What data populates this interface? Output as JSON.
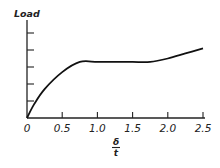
{
  "chart_data": {
    "type": "line",
    "title": "",
    "ylabel": "Load",
    "xlabel": "δ / t",
    "xlabel_numerator": "δ",
    "xlabel_denominator": "t",
    "x_ticks": [
      0,
      0.5,
      1.0,
      1.5,
      2.0,
      2.5
    ],
    "x_tick_labels": [
      "0",
      "0.5",
      "1.0",
      "1.5",
      "2.0",
      "2.5"
    ],
    "y_ticks_count": 5,
    "y_tick_labels": [],
    "xlim": [
      0,
      2.5
    ],
    "ylim": [
      0,
      5.4
    ],
    "grid": false,
    "legend": null,
    "series": [
      {
        "name": "Load vs δ/t",
        "x": [
          0,
          0.1,
          0.25,
          0.5,
          0.75,
          1.0,
          1.25,
          1.5,
          1.75,
          2.0,
          2.25,
          2.5
        ],
        "values": [
          0,
          0.8,
          1.7,
          2.7,
          3.3,
          3.3,
          3.3,
          3.3,
          3.3,
          3.5,
          3.8,
          4.1
        ]
      }
    ],
    "style": {
      "line_color": "#111111",
      "axis_color": "#222222"
    }
  }
}
